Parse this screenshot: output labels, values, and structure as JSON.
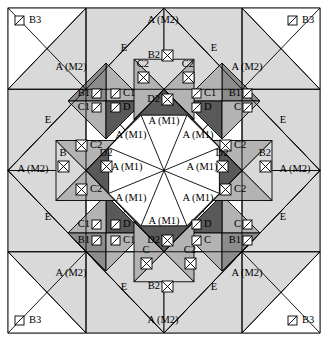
{
  "figure": {
    "frame": {
      "x": 8,
      "y": 8,
      "width": 312,
      "height": 325
    },
    "palette": {
      "white": "#ffffff",
      "light_gray": "#d9d9d9",
      "mid_gray": "#b3b3b3",
      "dark_gray": "#8c8c8c",
      "darker_gray": "#595959",
      "stroke": "#000000",
      "frame_stroke": "#808080"
    },
    "piece_names": [
      "A (M1)",
      "A (M2)",
      "B",
      "B1",
      "B2",
      "B3",
      "C",
      "C1",
      "C2",
      "D",
      "D2",
      "E"
    ],
    "marker_types": {
      "diagonal_box": "box with single diagonal slash",
      "crossed_box": "box with both diagonals (X)"
    }
  },
  "labels": {
    "corners": [
      {
        "id": "corner-tl-b3",
        "text": "B3",
        "x": 24,
        "y": 21,
        "marker": "diagonal_box",
        "marker_side": "left"
      },
      {
        "id": "corner-tr-b3",
        "text": "B3",
        "x": 297,
        "y": 21,
        "marker": "diagonal_box",
        "marker_side": "left"
      },
      {
        "id": "corner-bl-b3",
        "text": "B3",
        "x": 24,
        "y": 321,
        "marker": "diagonal_box",
        "marker_side": "left"
      },
      {
        "id": "corner-br-b3",
        "text": "B3",
        "x": 297,
        "y": 321,
        "marker": "diagonal_box",
        "marker_side": "left"
      }
    ],
    "outer_a_m2": [
      {
        "id": "a-m2-top-left",
        "text": "A (M2)",
        "x": 163,
        "y": 21
      },
      {
        "id": "a-m2-top-right",
        "text": "A (M2)",
        "x": 247,
        "y": 68
      },
      {
        "id": "a-m2-left-top",
        "text": "A (M2)",
        "x": 71,
        "y": 68
      },
      {
        "id": "a-m2-left-mid",
        "text": "A (M2)",
        "x": 33,
        "y": 170
      },
      {
        "id": "a-m2-right-mid",
        "text": "A (M2)",
        "x": 295,
        "y": 170
      },
      {
        "id": "a-m2-left-bot",
        "text": "A (M2)",
        "x": 71,
        "y": 274
      },
      {
        "id": "a-m2-right-bot",
        "text": "A (M2)",
        "x": 247,
        "y": 274
      },
      {
        "id": "a-m2-bottom",
        "text": "A (M2)",
        "x": 163,
        "y": 321
      }
    ],
    "e_pieces": [
      {
        "id": "e-top-left",
        "text": "E",
        "x": 124,
        "y": 49
      },
      {
        "id": "e-top-right",
        "text": "E",
        "x": 214,
        "y": 49
      },
      {
        "id": "e-left-top",
        "text": "E",
        "x": 48,
        "y": 121
      },
      {
        "id": "e-right-top",
        "text": "E",
        "x": 283,
        "y": 121
      },
      {
        "id": "e-left-bottom",
        "text": "E",
        "x": 48,
        "y": 218
      },
      {
        "id": "e-right-bottom",
        "text": "E",
        "x": 283,
        "y": 218
      },
      {
        "id": "e-bottom-left",
        "text": "E",
        "x": 124,
        "y": 288
      },
      {
        "id": "e-bottom-right",
        "text": "E",
        "x": 214,
        "y": 288
      }
    ],
    "center_a_m1": [
      {
        "id": "a-m1-n",
        "text": "A (M1)",
        "x": 164,
        "y": 122
      },
      {
        "id": "a-m1-nw",
        "text": "A (M1)",
        "x": 131,
        "y": 136
      },
      {
        "id": "a-m1-ne",
        "text": "A (M1)",
        "x": 198,
        "y": 136
      },
      {
        "id": "a-m1-w",
        "text": "A (M1)",
        "x": 127,
        "y": 168
      },
      {
        "id": "a-m1-e",
        "text": "A (M1)",
        "x": 202,
        "y": 168
      },
      {
        "id": "a-m1-sw",
        "text": "A (M1)",
        "x": 131,
        "y": 199
      },
      {
        "id": "a-m1-se",
        "text": "A (M1)",
        "x": 198,
        "y": 199
      },
      {
        "id": "a-m1-s",
        "text": "A (M1)",
        "x": 164,
        "y": 222
      }
    ],
    "diamond_tl": [
      {
        "id": "tl-b1",
        "text": "B1",
        "x": 89,
        "y": 94,
        "marker": "diagonal_box",
        "marker_side": "right"
      },
      {
        "id": "tl-c1",
        "text": "C1",
        "x": 124,
        "y": 94,
        "marker": "diagonal_box",
        "marker_side": "left"
      },
      {
        "id": "tl-c1b",
        "text": "C1",
        "x": 89,
        "y": 108,
        "marker": "diagonal_box",
        "marker_side": "right"
      },
      {
        "id": "tl-d",
        "text": "D",
        "x": 124,
        "y": 108,
        "marker": "diagonal_box",
        "marker_side": "left"
      }
    ],
    "diamond_tr": [
      {
        "id": "tr-c1",
        "text": "C1",
        "x": 205,
        "y": 94,
        "marker": "diagonal_box",
        "marker_side": "left"
      },
      {
        "id": "tr-b1",
        "text": "B1",
        "x": 240,
        "y": 94,
        "marker": "diagonal_box",
        "marker_side": "right"
      },
      {
        "id": "tr-d",
        "text": "D",
        "x": 205,
        "y": 108,
        "marker": "diagonal_box",
        "marker_side": "left"
      },
      {
        "id": "tr-c",
        "text": "C",
        "x": 240,
        "y": 108,
        "marker": "diagonal_box",
        "marker_side": "right"
      }
    ],
    "diamond_bl": [
      {
        "id": "bl-c1",
        "text": "C1",
        "x": 89,
        "y": 225,
        "marker": "diagonal_box",
        "marker_side": "right"
      },
      {
        "id": "bl-d",
        "text": "D",
        "x": 124,
        "y": 225,
        "marker": "diagonal_box",
        "marker_side": "left"
      },
      {
        "id": "bl-b1",
        "text": "B1",
        "x": 89,
        "y": 241,
        "marker": "diagonal_box",
        "marker_side": "right"
      },
      {
        "id": "bl-c1b",
        "text": "C1",
        "x": 124,
        "y": 241,
        "marker": "diagonal_box",
        "marker_side": "left"
      }
    ],
    "diamond_br": [
      {
        "id": "br-d",
        "text": "D",
        "x": 205,
        "y": 225,
        "marker": "diagonal_box",
        "marker_side": "left"
      },
      {
        "id": "br-c",
        "text": "C",
        "x": 240,
        "y": 225,
        "marker": "diagonal_box",
        "marker_side": "right"
      },
      {
        "id": "br-c2",
        "text": "C",
        "x": 205,
        "y": 241,
        "marker": "diagonal_box",
        "marker_side": "left"
      },
      {
        "id": "br-b1",
        "text": "B1",
        "x": 240,
        "y": 241,
        "marker": "diagonal_box",
        "marker_side": "right"
      }
    ],
    "edge_top": [
      {
        "id": "top-b2",
        "text": "B2",
        "x": 158,
        "y": 56,
        "marker": "crossed_box",
        "marker_side": "right"
      },
      {
        "id": "top-c2l",
        "text": "C2",
        "x": 143,
        "y": 71,
        "marker": "crossed_box",
        "marker_side": "below"
      },
      {
        "id": "top-c2r",
        "text": "C2",
        "x": 188,
        "y": 71,
        "marker": "crossed_box",
        "marker_side": "below"
      },
      {
        "id": "top-d2",
        "text": "D2",
        "x": 158,
        "y": 100,
        "marker": "crossed_box",
        "marker_side": "right"
      }
    ],
    "edge_bottom": [
      {
        "id": "bot-d2",
        "text": "D2",
        "x": 158,
        "y": 241,
        "marker": "crossed_box",
        "marker_side": "right"
      },
      {
        "id": "bot-cl",
        "text": "C",
        "x": 146,
        "y": 257,
        "marker": "crossed_box",
        "marker_side": "below"
      },
      {
        "id": "bot-c2r",
        "text": "C2",
        "x": 190,
        "y": 257,
        "marker": "crossed_box",
        "marker_side": "below"
      },
      {
        "id": "bot-b2",
        "text": "B2",
        "x": 158,
        "y": 287,
        "marker": "crossed_box",
        "marker_side": "right"
      }
    ],
    "edge_left": [
      {
        "id": "left-c2t",
        "text": "C2",
        "x": 92,
        "y": 146,
        "marker": "crossed_box",
        "marker_side": "left"
      },
      {
        "id": "left-b",
        "text": "B",
        "x": 63,
        "y": 160,
        "marker": "crossed_box",
        "marker_side": "below"
      },
      {
        "id": "left-d2",
        "text": "D2",
        "x": 106,
        "y": 160,
        "marker": "crossed_box",
        "marker_side": "below"
      },
      {
        "id": "left-c2b",
        "text": "C2",
        "x": 92,
        "y": 190,
        "marker": "crossed_box",
        "marker_side": "left"
      }
    ],
    "edge_right": [
      {
        "id": "right-c2t",
        "text": "C2",
        "x": 236,
        "y": 146,
        "marker": "crossed_box",
        "marker_side": "left"
      },
      {
        "id": "right-d2",
        "text": "D2",
        "x": 222,
        "y": 160,
        "marker": "crossed_box",
        "marker_side": "below"
      },
      {
        "id": "right-b2",
        "text": "B2",
        "x": 265,
        "y": 160,
        "marker": "crossed_box",
        "marker_side": "below"
      },
      {
        "id": "right-c2b",
        "text": "C2",
        "x": 236,
        "y": 190,
        "marker": "crossed_box",
        "marker_side": "left"
      }
    ]
  }
}
